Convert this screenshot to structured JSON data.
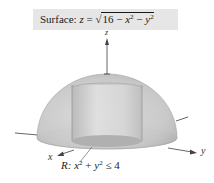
{
  "title": {
    "label": "Surface:",
    "lhs": "z",
    "equals": "=",
    "sqrt_open": "√",
    "radicand_const": "16",
    "minus1": "−",
    "term1_var": "x",
    "term1_exp": "2",
    "minus2": "−",
    "term2_var": "y",
    "term2_exp": "2"
  },
  "axes": {
    "x_label": "x",
    "y_label": "y",
    "z_label": "z"
  },
  "region": {
    "prefix": "R:",
    "var1": "x",
    "exp1": "2",
    "plus": "+",
    "var2": "y",
    "exp2": "2",
    "relation": "≤",
    "bound": "4"
  },
  "colors": {
    "title_bg": "#e6e6e6",
    "hemisphere_fill": "#c8c8c8",
    "cylinder_fill": "#d9d9d9",
    "axis": "#555555"
  }
}
